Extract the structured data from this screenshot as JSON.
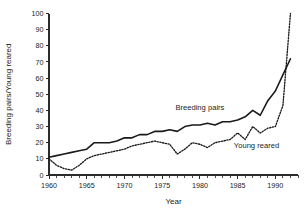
{
  "chart_data": {
    "type": "line",
    "title": "",
    "xlabel": "Year",
    "ylabel": "Breeding pairs/Young reared",
    "xlim": [
      1960,
      1993
    ],
    "ylim": [
      0,
      100
    ],
    "ytick_step": 10,
    "xtick_step": 5,
    "x_minor_step": 1,
    "grid": false,
    "legend_position": "inline-annotation",
    "x_tick_labels": [
      "1960",
      "1965",
      "1970",
      "1975",
      "1980",
      "1985",
      "1990"
    ],
    "x_tick_values": [
      1960,
      1965,
      1970,
      1975,
      1980,
      1985,
      1990
    ],
    "y_tick_labels": [
      "0",
      "10",
      "20",
      "30",
      "40",
      "50",
      "60",
      "70",
      "80",
      "90",
      "100"
    ],
    "y_tick_values": [
      0,
      10,
      20,
      30,
      40,
      50,
      60,
      70,
      80,
      90,
      100
    ],
    "x": [
      1960,
      1961,
      1962,
      1963,
      1964,
      1965,
      1966,
      1967,
      1968,
      1969,
      1970,
      1971,
      1972,
      1973,
      1974,
      1975,
      1976,
      1977,
      1978,
      1979,
      1980,
      1981,
      1982,
      1983,
      1984,
      1985,
      1986,
      1987,
      1988,
      1989,
      1990,
      1991,
      1992
    ],
    "series": [
      {
        "name": "Breeding pairs",
        "style": "solid",
        "annotation": "Breeding pairs",
        "values": [
          11,
          12,
          13,
          14,
          15,
          16,
          20,
          20,
          20,
          21,
          23,
          23,
          25,
          25,
          27,
          27,
          28,
          27,
          30,
          31,
          31,
          32,
          31,
          33,
          33,
          34,
          36,
          40,
          37,
          46,
          52,
          62,
          72
        ]
      },
      {
        "name": "Young reared",
        "style": "dotted",
        "annotation": "Young reared",
        "values": [
          10,
          6,
          4,
          3,
          6,
          10,
          12,
          13,
          14,
          15,
          16,
          18,
          19,
          20,
          21,
          20,
          19,
          13,
          16,
          20,
          19,
          17,
          20,
          21,
          22,
          26,
          22,
          30,
          26,
          29,
          30,
          43,
          100
        ]
      }
    ],
    "annotations": [
      {
        "text": "Breeding pairs",
        "x_value": 1980.0,
        "y_value": 40.5
      },
      {
        "text": "Young reared",
        "x_value": 1987.5,
        "y_value": 17.0
      }
    ]
  }
}
